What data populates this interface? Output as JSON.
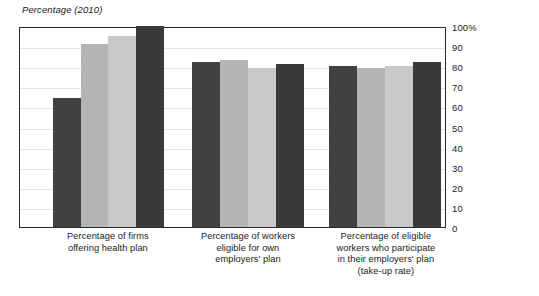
{
  "chart": {
    "title": "Percentage (2010)",
    "y_axis": {
      "ticks": [
        "100%",
        "90",
        "80",
        "70",
        "60",
        "50",
        "40",
        "30",
        "20",
        "10",
        "0"
      ],
      "min": 0,
      "max": 100
    }
  },
  "chart_data": {
    "type": "bar",
    "title": "Percentage (2010)",
    "xlabel": "",
    "ylabel": "Percentage (2010)",
    "ylim": [
      0,
      100
    ],
    "grid": true,
    "legend": "none",
    "categories": [
      "Percentage of firms offering health plan",
      "Percentage of workers eligible for own employers' plan",
      "Percentage of eligible workers who participate in their employers' plan (take-up rate)"
    ],
    "category_lines": [
      [
        "Percentage of firms",
        "offering health plan"
      ],
      [
        "Percentage of workers",
        "eligible for own",
        "employers' plan"
      ],
      [
        "Percentage of eligible",
        "workers who participate",
        "in their employers' plan",
        "(take-up rate)"
      ]
    ],
    "series": [
      {
        "name": "Series 1",
        "color": "#414141",
        "values": [
          64,
          82,
          80
        ]
      },
      {
        "name": "Series 2",
        "color": "#b4b4b4",
        "values": [
          91,
          83,
          79
        ]
      },
      {
        "name": "Series 3",
        "color": "#c9c9c9",
        "values": [
          95,
          79,
          80
        ]
      },
      {
        "name": "Series 4",
        "color": "#3a3a3a",
        "values": [
          100,
          81,
          82
        ]
      }
    ]
  },
  "geometry": {
    "group_starts_pct": [
      7.7,
      40.5,
      72.8
    ],
    "bar_width_pct": 6.56,
    "group_span_pct": 26.5
  }
}
